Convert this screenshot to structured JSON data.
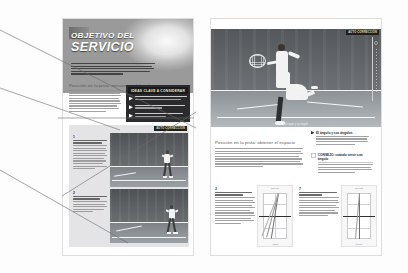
{
  "document": {
    "type": "book-spread-scan",
    "language": "es",
    "background_color": "#fdfdfd",
    "page_border_color": "#dedede"
  },
  "left_page": {
    "hero": {
      "title_line1": "OBJETIVO DEL",
      "title_line2": "SERVICIO",
      "intro_lines": 5
    },
    "section_heading": "Posición en la pista: encuentro el ángulo",
    "body_lines": 9,
    "key_box": {
      "header": "IDEAS CLAVE A CONSIDERAR",
      "items": [
        {
          "lead": "¿POR DÓNDE SACAR?",
          "lines": 2
        },
        {
          "lead": "¿CÓMO SACAR?",
          "lines": 2
        },
        {
          "lead": "EL SERVICIO COMO ARMA",
          "lines": 2
        }
      ]
    },
    "module": {
      "tag": "AUTO CORRECCIÓN",
      "steps": [
        {
          "number": "1",
          "title_lines": 2,
          "body_lines": 9
        },
        {
          "number": "2",
          "title_lines": 2,
          "body_lines": 5
        }
      ]
    }
  },
  "right_page": {
    "photo_tag": "AUTO CORRECCIÓN",
    "photo_caption": "El saque y su ángulo",
    "side_tab": "marcador lateral",
    "callout": {
      "number": "6",
      "title": "El ángulo y sus ángulos",
      "body_lines": 4
    },
    "note_box": {
      "header": "CONSEJO: cuándo servir con ángulo",
      "body_lines": 4
    },
    "section_heading": "Posición en la pista: obtener el espacio",
    "body_lines": 8,
    "diagrams": [
      {
        "number": "3",
        "title_lines": 2,
        "body_lines": 12,
        "top_caption": "Servicio",
        "bottom_caption": "Ángulo"
      },
      {
        "number": "7",
        "title_lines": 2,
        "body_lines": 9,
        "top_caption": "Servicio",
        "bottom_caption": "Centro"
      }
    ]
  },
  "annotations": {
    "leader_line_count": 5,
    "color": "#6b6b6b"
  }
}
